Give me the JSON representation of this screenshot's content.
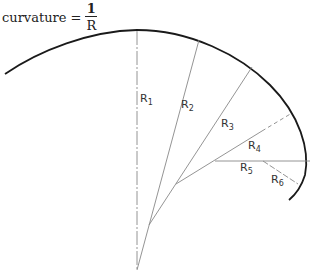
{
  "formula": {
    "lhs": "curvature",
    "equals": "=",
    "numerator": "1",
    "denominator": "R"
  },
  "radii": [
    {
      "label": "R",
      "sub": "1",
      "x": 140,
      "y": 102
    },
    {
      "label": "R",
      "sub": "2",
      "x": 181,
      "y": 108
    },
    {
      "label": "R",
      "sub": "3",
      "x": 221,
      "y": 127
    },
    {
      "label": "R",
      "sub": "4",
      "x": 248,
      "y": 149
    },
    {
      "label": "R",
      "sub": "5",
      "x": 240,
      "y": 171
    },
    {
      "label": "R",
      "sub": "6",
      "x": 271,
      "y": 183
    }
  ],
  "colors": {
    "curve": "#1a1a1a",
    "radius_line": "#888888"
  }
}
